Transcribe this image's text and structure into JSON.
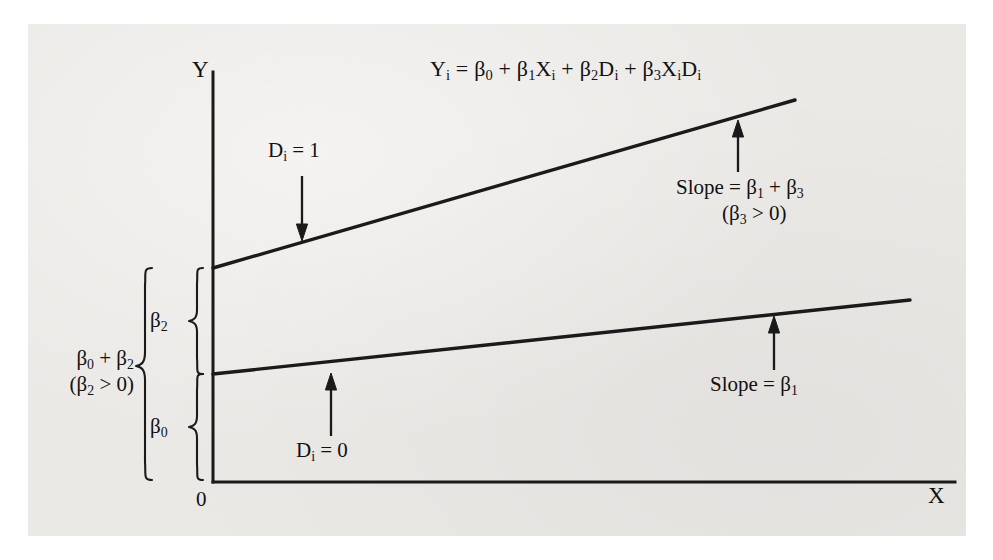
{
  "figure": {
    "equation_html": "Y<sub>i</sub> = β<sub>0</sub> + β<sub>1</sub>X<sub>i</sub> + β<sub>2</sub>D<sub>i</sub> + β<sub>3</sub>X<sub>i</sub>D<sub>i</sub>",
    "equation_text": "Yi = β0 + β1Xi + β2Di + β3XiDi",
    "background_color": "#ebe9e6",
    "line_color": "#1a1a1a",
    "text_color": "#111111"
  },
  "axes": {
    "y_label": "Y",
    "x_label": "X",
    "origin_label": "0"
  },
  "annotations": {
    "upper_group_html": "D<sub>i</sub> = 1",
    "upper_group_text": "Di = 1",
    "lower_group_html": "D<sub>i</sub> = 0",
    "lower_group_text": "Di = 0",
    "upper_slope_html": "Slope = β<sub>1</sub> + β<sub>3</sub>",
    "upper_slope_text": "Slope = β1 + β3",
    "upper_slope_condition_html": "(β<sub>3</sub> &gt; 0)",
    "upper_slope_condition_text": "(β3 > 0)",
    "lower_slope_html": "Slope = β<sub>1</sub>",
    "lower_slope_text": "Slope = β1"
  },
  "braces": {
    "beta2_label_html": "β<sub>2</sub>",
    "beta2_label_text": "β2",
    "beta0_label_html": "β<sub>0</sub>",
    "beta0_label_text": "β0",
    "outer_label_html": "β<sub>0</sub> + β<sub>2</sub>",
    "outer_label_text": "β0 + β2",
    "outer_condition_html": "(β<sub>2</sub> &gt; 0)",
    "outer_condition_text": "(β2 > 0)"
  },
  "chart_data": {
    "type": "line",
    "xlabel": "X",
    "ylabel": "Y",
    "grid": false,
    "legend_position": "inline-annotations",
    "axis_origin_label": "0",
    "model": "Yi = β0 + β1Xi + β2Di + β3XiDi",
    "parameters": {
      "beta0": "intercept for Di = 0 group",
      "beta1": "slope for Di = 0 group",
      "beta2": "differential intercept (β2 > 0)",
      "beta3": "differential slope (β3 > 0)"
    },
    "series": [
      {
        "name": "Di = 1",
        "equation": "Yi = (β0 + β2) + (β1 + β3)Xi",
        "intercept_label": "β0 + β2",
        "slope_label": "β1 + β3",
        "x": [
          0,
          1
        ],
        "y": [
          0.42,
          0.97
        ],
        "pixel_start": [
          213,
          268
        ],
        "pixel_end": [
          795,
          100
        ]
      },
      {
        "name": "Di = 0",
        "equation": "Yi = β0 + β1Xi",
        "intercept_label": "β0",
        "slope_label": "β1",
        "x": [
          0,
          1
        ],
        "y": [
          0.155,
          0.38
        ],
        "pixel_start": [
          213,
          374
        ],
        "pixel_end": [
          910,
          300
        ]
      }
    ],
    "annotations": [
      {
        "text": "Di = 1",
        "target": "upper line",
        "arrow": "down"
      },
      {
        "text": "Di = 0",
        "target": "lower line",
        "arrow": "up"
      },
      {
        "text": "Slope = β1 + β3 (β3 > 0)",
        "target": "upper line",
        "arrow": "up"
      },
      {
        "text": "Slope = β1",
        "target": "lower line",
        "arrow": "up"
      },
      {
        "text": "β2",
        "target": "gap between intercepts",
        "brace": true
      },
      {
        "text": "β0",
        "target": "lower intercept from origin",
        "brace": true
      },
      {
        "text": "β0 + β2 (β2 > 0)",
        "target": "upper intercept from origin",
        "brace": true
      }
    ]
  }
}
